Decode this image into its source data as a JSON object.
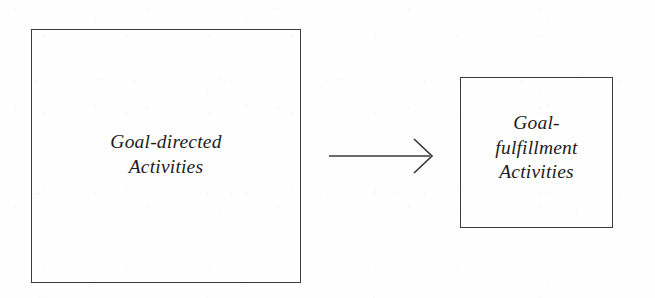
{
  "figure": {
    "type": "flow-diagram",
    "background_color": "#fefefe",
    "stroke_color": "#3b3b3b",
    "text_color": "#1d1d1d"
  },
  "nodes": [
    {
      "id": "goal-directed",
      "lines": [
        "Goal-directed",
        "Activities"
      ],
      "full_text": "Goal-directed Activities"
    },
    {
      "id": "goal-fulfillment",
      "lines": [
        "Goal-",
        "fulfillment",
        "Activities"
      ],
      "full_text": "Goal-fulfillment Activities"
    }
  ],
  "connectors": [
    {
      "id": "goal-directed-to-goal-fulfillment",
      "shape": "open-arrow",
      "direction": "left-to-right",
      "label": ""
    }
  ]
}
